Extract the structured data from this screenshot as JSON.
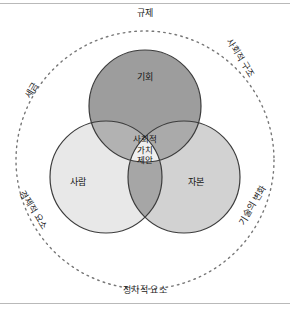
{
  "figure": {
    "title_present": false,
    "type": "venn-three-circle-with-outer-context-ring",
    "outer_ring": {
      "style": "dotted",
      "labels": {
        "top": "규제",
        "upper_right": "사회적 구조",
        "lower_right": "기술의 변화",
        "bottom": "정치적 요소",
        "lower_left": "경제적 요소",
        "upper_left": "세금"
      }
    },
    "circles": [
      {
        "key": "opportunity",
        "label": "기회",
        "position": "top",
        "fill": "#9d9d9d"
      },
      {
        "key": "people",
        "label": "사람",
        "position": "left",
        "fill": "#e6e6e6"
      },
      {
        "key": "capital",
        "label": "자본",
        "position": "right",
        "fill": "#cfcfcf"
      }
    ],
    "center": {
      "lines": [
        "사회적",
        "가치",
        "제안"
      ],
      "fill": "#efefef"
    },
    "colors": {
      "stroke": "#3c3c3c",
      "dotted_ring": "#777777",
      "frame_rule": "#b9b9b9",
      "background": "#ffffff",
      "text": "#1a1a1a"
    }
  }
}
